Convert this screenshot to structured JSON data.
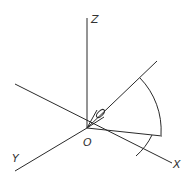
{
  "diagram": {
    "type": "3d-coordinate-system",
    "axes": {
      "z_label": "Z",
      "y_label": "Y",
      "x_label": "X",
      "origin_label": "O"
    },
    "colors": {
      "line": "#2a2a2a",
      "background": "#ffffff"
    },
    "elements": [
      "Z axis",
      "Y axis",
      "X axis",
      "direction ray",
      "projection ray",
      "cone at origin",
      "elevation arc",
      "azimuth arc"
    ]
  }
}
